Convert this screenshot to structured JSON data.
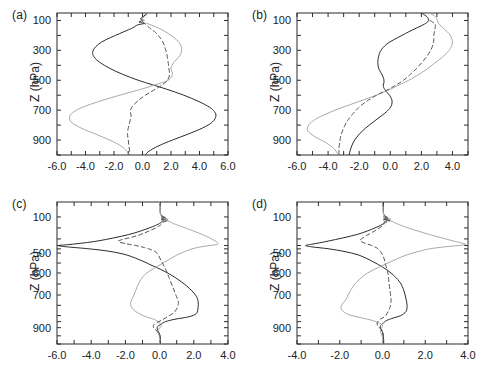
{
  "figure": {
    "width": 481,
    "height": 379,
    "background": "#ffffff",
    "axis_color": "#2b2b2b",
    "series_styles": {
      "dark_solid": {
        "color": "#2b2b2b",
        "width": 1.0,
        "dash": "none"
      },
      "gray_solid": {
        "color": "#a9a9a9",
        "width": 1.0,
        "dash": "none"
      },
      "dark_dashed": {
        "color": "#555555",
        "width": 1.0,
        "dash": "4,3"
      }
    }
  },
  "chart_data": [
    {
      "type": "line",
      "panel": "a",
      "label": "(a)",
      "title": "",
      "xlabel": "",
      "ylabel": "Z (hPa)",
      "xlim": [
        -6.0,
        6.0
      ],
      "ylim": [
        1000,
        50
      ],
      "y_inverted": true,
      "grid": false,
      "legend": "none",
      "xticks": [
        -6.0,
        -4.0,
        -2.0,
        0.0,
        2.0,
        4.0,
        6.0
      ],
      "xticklabels": [
        "-6.0",
        "-4.0",
        "-2.0",
        "0.0",
        "2.0",
        "4.0",
        "6.0"
      ],
      "xminorticks": [
        -5.0,
        -3.0,
        -1.0,
        1.0,
        3.0,
        5.0
      ],
      "yticks": [
        100,
        300,
        500,
        700,
        900
      ],
      "yticklabels": [
        "100",
        "300",
        "500",
        "700",
        "900"
      ],
      "yminorticks": [
        200,
        400,
        600,
        800,
        1000
      ],
      "series": [
        {
          "name": "dark_solid",
          "style": "dark_solid",
          "y": [
            50,
            70,
            90,
            100,
            110,
            120,
            130,
            150,
            175,
            200,
            230,
            260,
            290,
            320,
            350,
            380,
            420,
            460,
            500,
            530,
            560,
            600,
            640,
            680,
            710,
            740,
            780,
            820,
            860,
            900,
            940,
            975,
            1000
          ],
          "x": [
            0.35,
            0.1,
            -0.15,
            0.05,
            -0.25,
            0.1,
            -0.35,
            -0.7,
            -1.3,
            -1.9,
            -2.6,
            -3.1,
            -3.4,
            -3.5,
            -3.35,
            -3.0,
            -2.3,
            -1.4,
            -0.3,
            0.7,
            1.7,
            2.9,
            3.9,
            4.7,
            5.05,
            5.15,
            4.9,
            4.2,
            3.2,
            2.1,
            1.1,
            0.45,
            0.2
          ]
        },
        {
          "name": "gray_solid",
          "style": "gray_solid",
          "y": [
            50,
            70,
            90,
            100,
            110,
            120,
            130,
            150,
            175,
            200,
            230,
            260,
            290,
            320,
            350,
            380,
            420,
            460,
            500,
            530,
            560,
            600,
            640,
            680,
            710,
            740,
            780,
            820,
            860,
            900,
            940,
            975,
            1000
          ],
          "x": [
            0.4,
            0.2,
            -0.05,
            0.15,
            -0.1,
            0.3,
            0.6,
            1.1,
            1.6,
            2.0,
            2.4,
            2.65,
            2.75,
            2.7,
            2.5,
            2.2,
            2.0,
            2.1,
            1.8,
            0.9,
            -0.1,
            -1.6,
            -3.0,
            -4.2,
            -4.8,
            -5.1,
            -5.0,
            -4.3,
            -3.3,
            -2.3,
            -1.5,
            -1.1,
            -1.0
          ]
        },
        {
          "name": "dark_dashed",
          "style": "dark_dashed",
          "y": [
            110,
            125,
            150,
            175,
            200,
            230,
            260,
            290,
            320,
            350,
            380,
            420,
            460,
            500,
            530,
            560,
            600,
            640,
            680,
            710,
            740,
            780,
            820,
            860,
            900,
            940,
            975,
            1000
          ],
          "x": [
            0.0,
            0.2,
            0.5,
            0.85,
            1.1,
            1.35,
            1.5,
            1.6,
            1.7,
            1.75,
            1.8,
            1.85,
            1.9,
            1.75,
            1.4,
            0.9,
            0.2,
            -0.35,
            -0.75,
            -0.85,
            -0.8,
            -0.9,
            -1.0,
            -1.05,
            -1.0,
            -0.95,
            -0.9,
            -0.9
          ]
        }
      ]
    },
    {
      "type": "line",
      "panel": "b",
      "label": "(b)",
      "title": "",
      "xlabel": "",
      "ylabel": "Z (hPa)",
      "xlim": [
        -6.0,
        5.0
      ],
      "ylim": [
        1000,
        50
      ],
      "y_inverted": true,
      "grid": false,
      "legend": "none",
      "xticks": [
        -6.0,
        -4.0,
        -2.0,
        0.0,
        2.0,
        4.0
      ],
      "xticklabels": [
        "-6.0",
        "-4.0",
        "-2.0",
        "0.0",
        "2.0",
        "4.0"
      ],
      "xminorticks": [
        -5.0,
        -3.0,
        -1.0,
        1.0,
        3.0,
        5.0
      ],
      "yticks": [
        100,
        300,
        500,
        700,
        900
      ],
      "yticklabels": [
        "100",
        "300",
        "500",
        "700",
        "900"
      ],
      "yminorticks": [
        200,
        400,
        600,
        800,
        1000
      ],
      "series": [
        {
          "name": "dark_solid",
          "style": "dark_solid",
          "y": [
            50,
            70,
            90,
            110,
            130,
            150,
            175,
            200,
            230,
            260,
            300,
            340,
            380,
            420,
            450,
            480,
            510,
            540,
            570,
            600,
            630,
            660,
            690,
            720,
            760,
            800,
            840,
            880,
            920,
            960,
            1000
          ],
          "x": [
            2.0,
            2.3,
            2.45,
            2.4,
            2.1,
            1.7,
            1.2,
            0.75,
            0.2,
            -0.25,
            -0.6,
            -0.75,
            -0.8,
            -0.75,
            -0.6,
            -0.45,
            -0.4,
            -0.45,
            -0.3,
            -0.05,
            0.1,
            0.1,
            -0.05,
            -0.35,
            -0.85,
            -1.35,
            -1.8,
            -2.15,
            -2.4,
            -2.55,
            -2.65
          ]
        },
        {
          "name": "gray_solid",
          "style": "gray_solid",
          "y": [
            50,
            70,
            90,
            110,
            130,
            160,
            190,
            220,
            250,
            280,
            310,
            350,
            390,
            430,
            470,
            510,
            540,
            570,
            600,
            630,
            660,
            690,
            720,
            760,
            800,
            840,
            880,
            920,
            960,
            1000
          ],
          "x": [
            2.5,
            2.85,
            3.0,
            3.05,
            3.2,
            3.5,
            3.8,
            3.95,
            4.0,
            3.9,
            3.7,
            3.3,
            2.8,
            2.3,
            1.7,
            1.0,
            0.4,
            -0.2,
            -0.9,
            -1.7,
            -2.5,
            -3.3,
            -4.0,
            -4.8,
            -5.25,
            -5.3,
            -4.8,
            -4.1,
            -3.6,
            -3.35
          ]
        },
        {
          "name": "dark_dashed",
          "style": "dark_dashed",
          "y": [
            100,
            120,
            140,
            170,
            200,
            230,
            260,
            300,
            340,
            380,
            420,
            460,
            500,
            530,
            560,
            590,
            620,
            650,
            690,
            730,
            770,
            810,
            860,
            910,
            960,
            1000
          ],
          "x": [
            2.55,
            2.85,
            2.9,
            2.85,
            2.8,
            2.8,
            2.75,
            2.6,
            2.35,
            2.05,
            1.7,
            1.3,
            0.85,
            0.4,
            -0.1,
            -0.7,
            -1.2,
            -1.65,
            -2.1,
            -2.45,
            -2.75,
            -2.95,
            -3.15,
            -3.25,
            -3.3,
            -3.3
          ]
        }
      ]
    },
    {
      "type": "line",
      "panel": "c",
      "label": "(c)",
      "title": "",
      "xlabel": "",
      "ylabel": "Z (hPa)",
      "xlim": [
        -6.0,
        4.0
      ],
      "ylim": [
        1000,
        50
      ],
      "y_inverted": true,
      "grid": false,
      "legend": "none",
      "xticks": [
        -6.0,
        -4.0,
        -2.0,
        0.0,
        2.0,
        4.0
      ],
      "xticklabels": [
        "-6.0",
        "-4.0",
        "-2.0",
        "0.0",
        "2.0",
        "4.0"
      ],
      "xminorticks": [
        -5.0,
        -3.0,
        -1.0,
        1.0,
        3.0
      ],
      "yticks": [
        100,
        500,
        600,
        700,
        900
      ],
      "yticklabels": [
        "100",
        "500",
        "600",
        "700",
        "900"
      ],
      "yminorticks": [
        200,
        300,
        400,
        450,
        550,
        650,
        750,
        800,
        850,
        950,
        1000
      ],
      "series": [
        {
          "name": "dark_solid",
          "style": "dark_solid",
          "y": [
            50,
            90,
            110,
            120,
            130,
            140,
            160,
            200,
            260,
            330,
            380,
            400,
            420,
            450,
            480,
            510,
            540,
            560,
            590,
            620,
            660,
            700,
            730,
            760,
            790,
            810,
            830,
            850,
            870,
            900,
            940,
            980,
            1000
          ],
          "x": [
            0.05,
            0.05,
            0.35,
            0.1,
            0.45,
            0.15,
            0.0,
            -0.6,
            -1.8,
            -3.6,
            -5.1,
            -5.9,
            -5.4,
            -4.1,
            -2.9,
            -1.9,
            -1.0,
            -0.5,
            0.25,
            0.9,
            1.6,
            2.1,
            2.25,
            2.25,
            2.15,
            1.7,
            0.9,
            0.35,
            0.1,
            -0.15,
            0.0,
            0.05,
            0.05
          ]
        },
        {
          "name": "gray_solid",
          "style": "gray_solid",
          "y": [
            50,
            90,
            110,
            120,
            130,
            140,
            160,
            200,
            260,
            330,
            380,
            400,
            420,
            450,
            480,
            510,
            540,
            570,
            600,
            630,
            660,
            700,
            740,
            770,
            790,
            810,
            830,
            850,
            880,
            920,
            960,
            1000
          ],
          "x": [
            0.0,
            0.05,
            0.2,
            0.5,
            0.2,
            0.55,
            0.8,
            1.5,
            2.5,
            3.25,
            3.4,
            2.9,
            2.4,
            1.9,
            1.5,
            1.0,
            0.4,
            -0.2,
            -0.75,
            -1.1,
            -1.3,
            -1.5,
            -1.7,
            -1.55,
            -1.2,
            -0.8,
            -0.35,
            -0.1,
            0.1,
            -0.1,
            0.0,
            0.0
          ]
        },
        {
          "name": "dark_dashed",
          "style": "dark_dashed",
          "y": [
            100,
            115,
            125,
            135,
            150,
            180,
            220,
            270,
            330,
            370,
            400,
            430,
            460,
            500,
            540,
            580,
            620,
            660,
            700,
            740,
            780,
            810,
            840,
            870,
            900,
            940,
            980,
            1000
          ],
          "x": [
            0.1,
            0.35,
            0.1,
            0.4,
            0.2,
            0.0,
            -0.5,
            -1.3,
            -2.4,
            -2.0,
            -1.4,
            -0.9,
            -0.5,
            -0.15,
            0.1,
            0.35,
            0.55,
            0.75,
            0.95,
            1.1,
            0.9,
            0.45,
            0.1,
            -0.3,
            -0.35,
            0.0,
            0.05,
            0.05
          ]
        }
      ]
    },
    {
      "type": "line",
      "panel": "d",
      "label": "(d)",
      "title": "",
      "xlabel": "",
      "ylabel": "Z (hPa)",
      "xlim": [
        -4.0,
        4.0
      ],
      "ylim": [
        1000,
        50
      ],
      "y_inverted": true,
      "grid": false,
      "legend": "none",
      "xticks": [
        -4.0,
        -2.0,
        0.0,
        2.0,
        4.0
      ],
      "xticklabels": [
        "-4.0",
        "-2.0",
        "0.0",
        "2.0",
        "4.0"
      ],
      "xminorticks": [
        -3.0,
        -1.0,
        1.0,
        3.0
      ],
      "yticks": [
        100,
        500,
        600,
        700,
        900
      ],
      "yticklabels": [
        "100",
        "500",
        "600",
        "700",
        "900"
      ],
      "yminorticks": [
        200,
        300,
        400,
        450,
        550,
        650,
        750,
        800,
        850,
        950,
        1000
      ],
      "series": [
        {
          "name": "dark_solid",
          "style": "dark_solid",
          "y": [
            50,
            90,
            110,
            120,
            130,
            140,
            160,
            200,
            260,
            330,
            380,
            400,
            420,
            450,
            480,
            510,
            540,
            570,
            600,
            640,
            680,
            720,
            750,
            780,
            800,
            820,
            840,
            860,
            890,
            930,
            970,
            1000
          ],
          "x": [
            0.05,
            0.05,
            0.25,
            0.05,
            0.35,
            0.1,
            0.05,
            -0.35,
            -1.2,
            -2.5,
            -3.3,
            -3.6,
            -3.3,
            -2.5,
            -1.8,
            -1.1,
            -0.5,
            0.0,
            0.4,
            0.8,
            1.0,
            1.1,
            1.15,
            1.1,
            0.85,
            0.5,
            0.2,
            0.05,
            -0.1,
            0.0,
            0.05,
            0.05
          ]
        },
        {
          "name": "gray_solid",
          "style": "gray_solid",
          "y": [
            50,
            90,
            110,
            120,
            130,
            140,
            160,
            200,
            260,
            330,
            380,
            400,
            420,
            450,
            480,
            510,
            540,
            570,
            600,
            640,
            680,
            720,
            760,
            790,
            810,
            830,
            850,
            880,
            920,
            960,
            1000
          ],
          "x": [
            0.0,
            0.05,
            0.15,
            0.4,
            0.15,
            0.45,
            0.65,
            1.2,
            2.2,
            3.3,
            3.9,
            3.5,
            2.9,
            2.2,
            1.7,
            1.1,
            0.45,
            -0.15,
            -0.7,
            -1.2,
            -1.5,
            -1.7,
            -1.95,
            -1.7,
            -1.2,
            -0.7,
            -0.3,
            0.0,
            -0.1,
            0.0,
            0.0
          ]
        },
        {
          "name": "dark_dashed",
          "style": "dark_dashed",
          "y": [
            100,
            115,
            125,
            135,
            150,
            180,
            220,
            270,
            320,
            360,
            400,
            440,
            480,
            520,
            560,
            600,
            640,
            680,
            720,
            760,
            800,
            830,
            860,
            890,
            920,
            960,
            1000
          ],
          "x": [
            0.05,
            0.3,
            0.05,
            0.35,
            0.15,
            0.0,
            -0.3,
            -0.75,
            -1.05,
            -0.85,
            -0.5,
            -0.25,
            -0.1,
            0.05,
            0.15,
            0.25,
            0.3,
            0.35,
            0.4,
            0.35,
            0.15,
            -0.1,
            -0.25,
            -0.2,
            0.0,
            0.05,
            0.05
          ]
        }
      ]
    }
  ]
}
